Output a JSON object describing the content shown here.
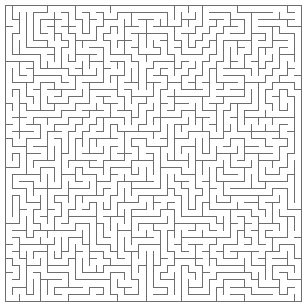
{
  "app": {
    "title": "Maze",
    "kind": "maze-puzzle"
  },
  "canvas": {
    "width": 308,
    "height": 302,
    "background_color": "#ffffff"
  },
  "maze": {
    "type": "perfect-maze",
    "algorithm": "recursive-backtracker",
    "seed": 20240517,
    "columns": 42,
    "rows": 42,
    "cell_size": 7.05,
    "origin_x": 5,
    "origin_y": 5,
    "wall_color": "#6e6e6e",
    "wall_width": 1,
    "border_color": "#6e6e6e",
    "border_width": 1,
    "has_outer_border": true,
    "entrance": "none-visible",
    "exit": "none-visible",
    "solution_shown": false
  },
  "labels": {
    "title_text": "",
    "caption_text": "",
    "status_text": ""
  }
}
